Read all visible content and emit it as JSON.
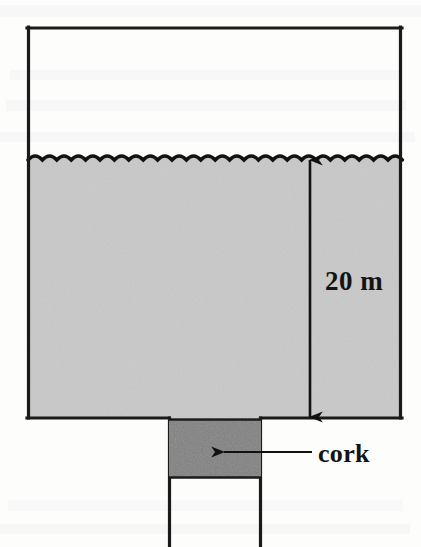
{
  "figure": {
    "kind": "physics-diagram",
    "background_color": "#fdfdfc"
  },
  "tank": {
    "outline_color": "#1a1a1a",
    "interior_color": "#ffffff",
    "left": 27,
    "right": 402,
    "top": 27,
    "bottom": 418
  },
  "water": {
    "fill_color": "#c9c9c9",
    "surface_color": "#121212",
    "surface_y": 158,
    "surface_wave_count": 26,
    "surface_wave_amplitude": 4
  },
  "neck": {
    "wall_color": "#1a1a1a",
    "left": 168,
    "right": 262,
    "top": 418,
    "bottom": 547
  },
  "cork": {
    "label": "cork",
    "fill_color": "#808080",
    "outline_color": "#1a1a1a",
    "left": 168,
    "right": 262,
    "top": 420,
    "bottom": 478
  },
  "cork_leader": {
    "line_color": "#111111",
    "arrow_tip_x": 222,
    "line_y": 452,
    "line_start_x": 312
  },
  "dimension": {
    "label": "20 m",
    "value": 20,
    "unit": "m",
    "arrow_color": "#111111",
    "arrow_x": 310,
    "arrow_top_y": 158,
    "arrow_bottom_y": 418,
    "label_x": 325,
    "label_y": 290
  }
}
